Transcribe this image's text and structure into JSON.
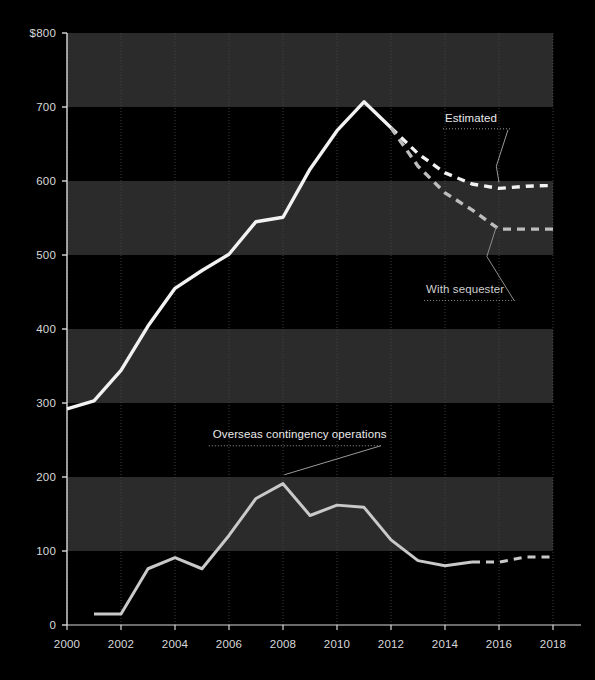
{
  "meta": {
    "background_color": "#000000",
    "band_color_a": "#2b2b2b",
    "band_color_b": "#000000",
    "axis_color": "#d8d8d8",
    "gridline_color": "#4a4a4a",
    "series_primary_color": "#f2f2f2",
    "series_sequester_color": "#bdbdbd",
    "series_oco_color": "#c9c9c9"
  },
  "chart_data": {
    "type": "line",
    "title": "",
    "xlabel": "",
    "ylabel": "",
    "xlim": [
      2000,
      2018
    ],
    "ylim": [
      0,
      800
    ],
    "grid": true,
    "legend": "annotations-inline",
    "x_ticks": [
      "2000",
      "2002",
      "2004",
      "2006",
      "2008",
      "2010",
      "2012",
      "2014",
      "2016",
      "2018"
    ],
    "x_tick_values": [
      2000,
      2002,
      2004,
      2006,
      2008,
      2010,
      2012,
      2014,
      2016,
      2018
    ],
    "y_ticks": [
      "0",
      "100",
      "200",
      "300",
      "400",
      "500",
      "600",
      "700",
      "$800"
    ],
    "y_tick_values": [
      0,
      100,
      200,
      300,
      400,
      500,
      600,
      700,
      800
    ],
    "y_axis_unit_prefix": "$",
    "series": [
      {
        "name": "Base defense budget",
        "style": "solid",
        "color": "#f2f2f2",
        "x": [
          2000,
          2001,
          2002,
          2003,
          2004,
          2005,
          2006,
          2007,
          2008,
          2009,
          2010,
          2011,
          2012
        ],
        "values": [
          292,
          303,
          344,
          404,
          455,
          479,
          501,
          545,
          551,
          616,
          668,
          707,
          672
        ]
      },
      {
        "name": "Estimated",
        "style": "dashed",
        "color": "#f2f2f2",
        "x": [
          2012,
          2013,
          2014,
          2015,
          2016,
          2017,
          2018
        ],
        "values": [
          672,
          637,
          611,
          596,
          590,
          593,
          594
        ]
      },
      {
        "name": "With sequester",
        "style": "dashed",
        "color": "#bdbdbd",
        "x": [
          2012,
          2013,
          2014,
          2015,
          2016,
          2017,
          2018
        ],
        "values": [
          672,
          620,
          584,
          561,
          535,
          535,
          535
        ]
      },
      {
        "name": "Overseas contingency operations",
        "style": "solid",
        "color": "#c9c9c9",
        "x": [
          2001,
          2002,
          2003,
          2004,
          2005,
          2006,
          2007,
          2008,
          2009,
          2010,
          2011,
          2012,
          2013,
          2014,
          2015
        ],
        "values": [
          15,
          15,
          76,
          91,
          76,
          121,
          171,
          191,
          148,
          162,
          159,
          115,
          87,
          80,
          85
        ]
      },
      {
        "name": "Overseas contingency operations (projected)",
        "style": "dashed",
        "color": "#c9c9c9",
        "x": [
          2015,
          2016,
          2017,
          2018
        ],
        "values": [
          85,
          85,
          92,
          92
        ]
      }
    ],
    "annotations": [
      {
        "text": "Estimated",
        "x": 2014.0,
        "y": 680
      },
      {
        "text": "With sequester",
        "x": 2013.3,
        "y": 448
      },
      {
        "text": "Overseas contingency operations",
        "x": 2005.4,
        "y": 253
      }
    ]
  }
}
